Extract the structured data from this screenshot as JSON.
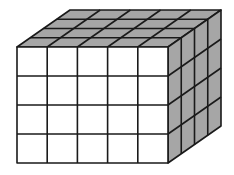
{
  "diagram": {
    "type": "unit-cube-rectangular-prism",
    "dimensions": {
      "length": 5,
      "depth": 4,
      "height": 4
    },
    "geometry": {
      "front_origin": [
        17,
        47
      ],
      "front_width": 151,
      "front_height": 116,
      "depth_offset": [
        53,
        -37
      ]
    },
    "colors": {
      "front_face": "#ffffff",
      "top_face": "#a6a6a6",
      "side_face": "#a6a6a6",
      "line": "#1a1a1a",
      "background": "#ffffff"
    },
    "line_width": 1.6
  }
}
